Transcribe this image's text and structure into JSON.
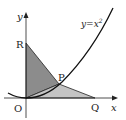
{
  "diagram": {
    "curve_label": "y=x",
    "curve_exponent": "2",
    "x_axis_label": "x",
    "y_axis_label": "y",
    "points": {
      "origin": "O",
      "R": "R",
      "P": "P",
      "Q": "Q"
    },
    "colors": {
      "triangle_ORP": "#8c8c8c",
      "triangle_OPQ": "#c4c4c4",
      "lines": "#222222"
    }
  }
}
